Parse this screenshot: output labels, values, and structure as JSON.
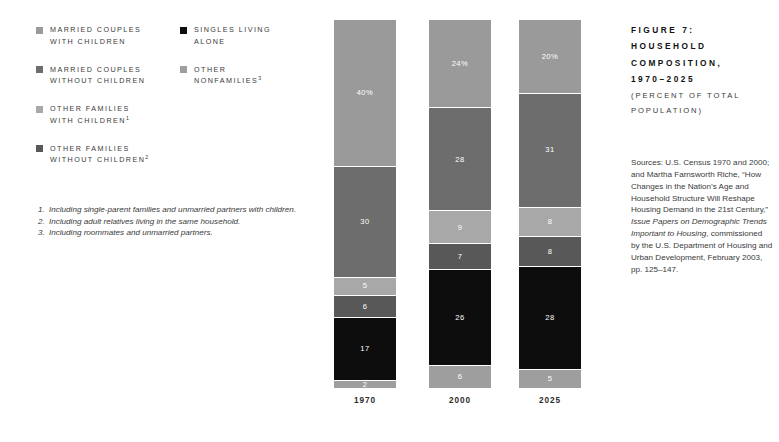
{
  "figure": {
    "title_lines": [
      "FIGURE 7:",
      "HOUSEHOLD",
      "COMPOSITION,",
      "1970–2025"
    ],
    "subtitle_lines": [
      "(PERCENT OF TOTAL",
      "POPULATION)"
    ]
  },
  "sources": {
    "part1": "Sources: U.S. Census 1970 and 2000; and Martha Farnsworth Riche, “How Changes in the Nation’s Age and Household Structure Will Reshape Housing Demand in the 21st Century,” ",
    "italic1": "Issue Papers on Demographic Trends Important to Housing",
    "part2": ", commissioned by the U.S. Department of Housing and Urban Development, February 2003, pp. 125–147."
  },
  "legend": {
    "column_a": [
      {
        "label": "MARRIED COUPLES\nWITH CHILDREN",
        "color": "#9a9a9a",
        "footnote": ""
      },
      {
        "label": "MARRIED COUPLES\nWITHOUT CHILDREN",
        "color": "#6d6d6d",
        "footnote": ""
      },
      {
        "label": "OTHER FAMILIES\nWITH CHILDREN",
        "color": "#a8a8a8",
        "footnote": "1"
      },
      {
        "label": "OTHER FAMILIES\nWITHOUT CHILDREN",
        "color": "#585858",
        "footnote": "2"
      }
    ],
    "column_b": [
      {
        "label": "SINGLES LIVING\nALONE",
        "color": "#0d0d0d",
        "footnote": ""
      },
      {
        "label": "OTHER\nNONFAMILIES",
        "color": "#9e9e9e",
        "footnote": "3"
      }
    ]
  },
  "footnotes": [
    {
      "num": "1.",
      "text": "Including single-parent families and unmarried partners with children."
    },
    {
      "num": "2.",
      "text": "Including adult relatives living in the same household."
    },
    {
      "num": "3.",
      "text": "Including roommates and unmarried partners."
    }
  ],
  "chart_data": {
    "type": "bar",
    "subtitle": "(PERCENT OF TOTAL POPULATION)",
    "stacked": true,
    "orientation": "vertical",
    "xlabel": "",
    "ylabel": "Percent of total population",
    "ylim": [
      0,
      100
    ],
    "grid": false,
    "legend_position": "top-left",
    "categories": [
      "1970",
      "2000",
      "2025"
    ],
    "series": [
      {
        "name": "MARRIED COUPLES WITH CHILDREN",
        "color": "#9a9a9a",
        "values": [
          40,
          24,
          20
        ]
      },
      {
        "name": "MARRIED COUPLES WITHOUT CHILDREN",
        "color": "#6d6d6d",
        "values": [
          30,
          28,
          31
        ]
      },
      {
        "name": "OTHER FAMILIES WITH CHILDREN",
        "color": "#a8a8a8",
        "values": [
          5,
          9,
          8
        ]
      },
      {
        "name": "OTHER FAMILIES WITHOUT CHILDREN",
        "color": "#585858",
        "values": [
          6,
          7,
          8
        ]
      },
      {
        "name": "SINGLES LIVING ALONE",
        "color": "#0d0d0d",
        "values": [
          17,
          26,
          28
        ]
      },
      {
        "name": "OTHER NONFAMILIES",
        "color": "#9e9e9e",
        "values": [
          2,
          6,
          5
        ]
      }
    ],
    "bars": [
      {
        "category": "1970",
        "segments": [
          {
            "series": "MARRIED COUPLES WITH CHILDREN",
            "value": 40,
            "label": "40%",
            "color": "#9a9a9a"
          },
          {
            "series": "MARRIED COUPLES WITHOUT CHILDREN",
            "value": 30,
            "label": "30",
            "color": "#6d6d6d"
          },
          {
            "series": "OTHER FAMILIES WITH CHILDREN",
            "value": 5,
            "label": "5",
            "color": "#a8a8a8"
          },
          {
            "series": "OTHER FAMILIES WITHOUT CHILDREN",
            "value": 6,
            "label": "6",
            "color": "#585858"
          },
          {
            "series": "SINGLES LIVING ALONE",
            "value": 17,
            "label": "17",
            "color": "#0d0d0d"
          },
          {
            "series": "OTHER NONFAMILIES",
            "value": 2,
            "label": "2",
            "color": "#9e9e9e"
          }
        ]
      },
      {
        "category": "2000",
        "segments": [
          {
            "series": "MARRIED COUPLES WITH CHILDREN",
            "value": 24,
            "label": "24%",
            "color": "#9a9a9a"
          },
          {
            "series": "MARRIED COUPLES WITHOUT CHILDREN",
            "value": 28,
            "label": "28",
            "color": "#6d6d6d"
          },
          {
            "series": "OTHER FAMILIES WITH CHILDREN",
            "value": 9,
            "label": "9",
            "color": "#a8a8a8"
          },
          {
            "series": "OTHER FAMILIES WITHOUT CHILDREN",
            "value": 7,
            "label": "7",
            "color": "#585858"
          },
          {
            "series": "SINGLES LIVING ALONE",
            "value": 26,
            "label": "26",
            "color": "#0d0d0d"
          },
          {
            "series": "OTHER NONFAMILIES",
            "value": 6,
            "label": "6",
            "color": "#9e9e9e"
          }
        ]
      },
      {
        "category": "2025",
        "segments": [
          {
            "series": "MARRIED COUPLES WITH CHILDREN",
            "value": 20,
            "label": "20%",
            "color": "#9a9a9a"
          },
          {
            "series": "MARRIED COUPLES WITHOUT CHILDREN",
            "value": 31,
            "label": "31",
            "color": "#6d6d6d"
          },
          {
            "series": "OTHER FAMILIES WITH CHILDREN",
            "value": 8,
            "label": "8",
            "color": "#a8a8a8"
          },
          {
            "series": "OTHER FAMILIES WITHOUT CHILDREN",
            "value": 8,
            "label": "8",
            "color": "#585858"
          },
          {
            "series": "SINGLES LIVING ALONE",
            "value": 28,
            "label": "28",
            "color": "#0d0d0d"
          },
          {
            "series": "OTHER NONFAMILIES",
            "value": 5,
            "label": "5",
            "color": "#9e9e9e"
          }
        ]
      }
    ]
  }
}
